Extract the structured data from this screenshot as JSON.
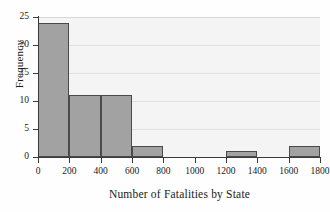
{
  "chart_data": {
    "type": "bar",
    "title": "",
    "subtitle": "",
    "xlabel": "Number of Fatalities by State",
    "ylabel": "Frequency",
    "xlim": [
      0,
      1800
    ],
    "ylim": [
      0,
      25
    ],
    "grid": "horizontal",
    "legend": "none",
    "bin_width": 200,
    "bin_edges": [
      0,
      200,
      400,
      600,
      800,
      1000,
      1200,
      1400,
      1600,
      1800
    ],
    "categories": [
      "0-200",
      "200-400",
      "400-600",
      "600-800",
      "800-1000",
      "1000-1200",
      "1200-1400",
      "1400-1600",
      "1600-1800"
    ],
    "values": [
      24,
      11,
      11,
      2,
      0,
      0,
      1,
      0,
      2
    ],
    "xticks": [
      "0",
      "200",
      "400",
      "600",
      "800",
      "1000",
      "1200",
      "1400",
      "1600",
      "1800"
    ],
    "xtick_values": [
      0,
      200,
      400,
      600,
      800,
      1000,
      1200,
      1400,
      1600,
      1800
    ],
    "yticks": [
      "0",
      "5",
      "10",
      "15",
      "20",
      "25"
    ],
    "ytick_values": [
      0,
      5,
      10,
      15,
      20,
      25
    ],
    "bar_fill_color": "#a2a2a2",
    "bar_edge_color": "#4a4a4a",
    "plot_background_color": "#f4f4f4",
    "gridline_color": "#e0e0e0",
    "axis_color": "#3a3a3a"
  }
}
